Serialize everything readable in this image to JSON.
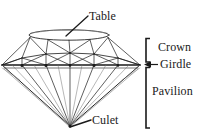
{
  "figure": {
    "background_color": "#ffffff",
    "line_color": "#1a1a1a",
    "text_color": "#1a1a1a",
    "width": 204,
    "height": 138
  },
  "labels": {
    "table": "Table",
    "crown": "Crown",
    "girdle": "Girdle",
    "pavilion": "Pavilion",
    "culet": "Culet"
  },
  "annotations": {
    "table_leader": "leader-line from Table label down-left to table facet",
    "culet_leader": "leader-line from Culet label up-left to culet point",
    "girdle_arrow": "left-pointing arrow from Girdle label to girdle level",
    "crown_bracket": "vertical bracket spanning the crown section",
    "pavilion_bracket": "vertical bracket spanning the pavilion section"
  },
  "geometry": {
    "girdle_y": 65,
    "table_center_x": 69,
    "table_center_y": 35,
    "table_rx": 40,
    "table_ry": 5,
    "culet_x": 70,
    "culet_y": 126,
    "girdle_left_x": 2,
    "girdle_right_x": 140,
    "crown_bracket_top": 38,
    "crown_bracket_bottom": 62,
    "pavilion_bracket_top": 67,
    "pavilion_bracket_bottom": 128,
    "bracket_x": 146
  }
}
